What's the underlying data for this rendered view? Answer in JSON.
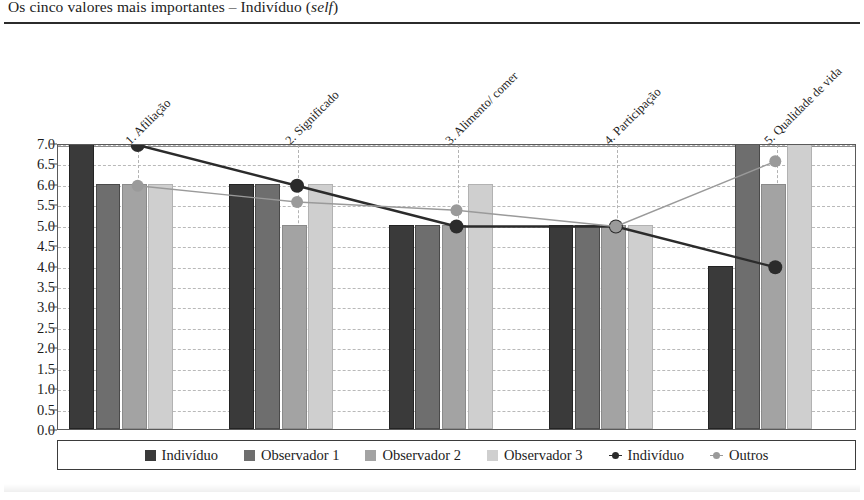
{
  "title": {
    "main": "Os cinco valores mais importantes – Indivíduo (",
    "emphasis": "self",
    "tail": ")"
  },
  "chart_data": {
    "type": "bar",
    "title": "Os cinco valores mais importantes – Indivíduo (self)",
    "xlabel": "",
    "ylabel": "",
    "ylim": [
      0,
      7
    ],
    "ytick_step": 0.5,
    "grid": true,
    "legend_position": "bottom",
    "categories": [
      "1. Afiliação",
      "2. Significado",
      "3. Alimento/ comer",
      "4. Participação",
      "5. Qualidade de vida"
    ],
    "ytick_labels": [
      "0.0",
      "0.5",
      "1.0",
      "1.5",
      "2.0",
      "2.5",
      "3.0",
      "3.5",
      "4.0",
      "4.5",
      "5.0",
      "5.5",
      "6.0",
      "6.5",
      "7.0"
    ],
    "series": [
      {
        "name": "Indivíduo",
        "kind": "bar",
        "color": "#3a3a3a",
        "values": [
          7.0,
          6.0,
          5.0,
          5.0,
          4.0
        ]
      },
      {
        "name": "Observador 1",
        "kind": "bar",
        "color": "#6e6e6e",
        "values": [
          6.0,
          6.0,
          5.0,
          5.0,
          7.0
        ]
      },
      {
        "name": "Observador 2",
        "kind": "bar",
        "color": "#a3a3a3",
        "values": [
          6.0,
          5.0,
          5.0,
          5.0,
          6.0
        ]
      },
      {
        "name": "Observador 3",
        "kind": "bar",
        "color": "#cfcfcf",
        "values": [
          6.0,
          6.0,
          6.0,
          5.0,
          7.0
        ]
      },
      {
        "name": "Indivíduo",
        "kind": "line",
        "color": "#2b2b2b",
        "values": [
          7.0,
          6.0,
          5.0,
          5.0,
          4.0
        ]
      },
      {
        "name": "Outros",
        "kind": "line",
        "color": "#9a9a9a",
        "values": [
          6.0,
          5.6,
          5.4,
          5.0,
          6.6
        ]
      }
    ]
  }
}
